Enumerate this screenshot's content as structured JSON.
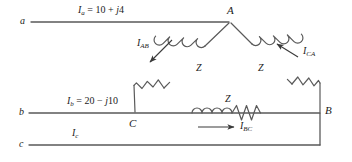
{
  "figure": {
    "type": "circuit-diagram",
    "background_color": "#ffffff",
    "line_color": "#555555",
    "text_color": "#1b1b1b"
  },
  "terminals": [
    {
      "id": "a",
      "label": "a"
    },
    {
      "id": "b",
      "label": "b"
    },
    {
      "id": "c",
      "label": "c"
    }
  ],
  "nodes": [
    {
      "id": "A",
      "label": "A"
    },
    {
      "id": "B",
      "label": "B"
    },
    {
      "id": "C",
      "label": "C"
    }
  ],
  "line_currents": [
    {
      "id": "Ia",
      "symbol": "I",
      "subscript": "a",
      "equals": "=",
      "value": "10 + j4",
      "text": "Ia = 10 + j4"
    },
    {
      "id": "Ib",
      "symbol": "I",
      "subscript": "b",
      "equals": "=",
      "value": "20 − j10",
      "text": "Ib = 20 − j10"
    },
    {
      "id": "Ic",
      "symbol": "I",
      "subscript": "c",
      "equals": "",
      "value": "",
      "text": "Ic"
    }
  ],
  "phase_currents": [
    {
      "id": "IAB",
      "symbol": "I",
      "subscript": "AB",
      "direction": "toward C (down-left)"
    },
    {
      "id": "ICA",
      "symbol": "I",
      "subscript": "CA",
      "direction": "toward A (up-left)"
    },
    {
      "id": "IBC",
      "symbol": "I",
      "subscript": "BC",
      "direction": "toward B (right)"
    }
  ],
  "impedances": [
    {
      "id": "Z_AB",
      "label": "Z",
      "branch": "A-C",
      "elements": [
        "inductor",
        "resistor"
      ]
    },
    {
      "id": "Z_CA",
      "label": "Z",
      "branch": "A-B",
      "elements": [
        "inductor",
        "resistor"
      ]
    },
    {
      "id": "Z_BC",
      "label": "Z",
      "branch": "C-B",
      "elements": [
        "inductor",
        "resistor"
      ]
    }
  ]
}
